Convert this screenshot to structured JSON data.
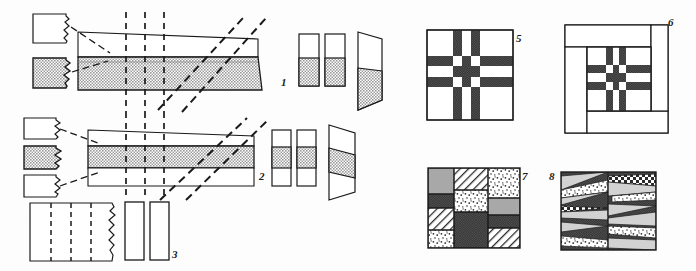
{
  "figure": {
    "type": "scientific-line-drawing",
    "background_color": "#fdfdfd",
    "ink_color": "#1a1a1a",
    "fill_gray": "#a8a8a8",
    "fill_dark": "#3a3a3a",
    "fill_white": "#ffffff"
  },
  "labels": [
    {
      "id": "label-1",
      "text": "1",
      "x": 281,
      "y": 76
    },
    {
      "id": "label-2",
      "text": "2",
      "x": 259,
      "y": 176
    },
    {
      "id": "label-3",
      "text": "3",
      "x": 172,
      "y": 253
    },
    {
      "id": "label-5",
      "text": "5",
      "x": 516,
      "y": 36
    },
    {
      "id": "label-6",
      "text": "6",
      "x": 668,
      "y": 20
    },
    {
      "id": "label-7",
      "text": "7",
      "x": 520,
      "y": 176
    },
    {
      "id": "label-8",
      "text": "8",
      "x": 553,
      "y": 174
    }
  ],
  "panel1": {
    "name": "band-1-two-layer-slanted",
    "samples": [
      {
        "id": "sample-1-top",
        "fill": "#ffffff",
        "x": 33,
        "y": 14,
        "w": 38,
        "h": 29
      },
      {
        "id": "sample-1-bottom",
        "fill": "#a8a8a8",
        "x": 33,
        "y": 58,
        "w": 38,
        "h": 30
      }
    ],
    "band": {
      "top_layer_fill": "#ffffff",
      "bottom_layer_fill": "#a8a8a8",
      "x_start": 78,
      "x_end": 255
    },
    "columns": [
      {
        "id": "col-1a",
        "x": 298,
        "y": 34,
        "w": 20,
        "h": 52,
        "white_h": 24,
        "gray_h": 28
      },
      {
        "id": "col-1b",
        "x": 324,
        "y": 34,
        "w": 20,
        "h": 52,
        "white_h": 24,
        "gray_h": 28
      }
    ],
    "parallelogram": {
      "id": "par-1",
      "white_top": true,
      "gray_bottom": true
    }
  },
  "panel2": {
    "name": "band-2-three-layer-slanted",
    "samples": [
      {
        "id": "sample-2-top",
        "fill": "#ffffff",
        "x": 24,
        "y": 118,
        "w": 38,
        "h": 22
      },
      {
        "id": "sample-2-mid",
        "fill": "#a8a8a8",
        "x": 24,
        "y": 146,
        "w": 38,
        "h": 24
      },
      {
        "id": "sample-2-bot",
        "fill": "#ffffff",
        "x": 24,
        "y": 175,
        "w": 38,
        "h": 22
      }
    ],
    "band": {
      "top_layer_fill": "#ffffff",
      "mid_layer_fill": "#a8a8a8",
      "bottom_layer_fill": "#ffffff",
      "x_start": 88,
      "x_end": 253
    },
    "columns": [
      {
        "id": "col-2a",
        "x": 272,
        "y": 130,
        "w": 19,
        "h": 56
      },
      {
        "id": "col-2b",
        "x": 296,
        "y": 130,
        "w": 19,
        "h": 56
      }
    ],
    "parallelogram": {
      "id": "par-2",
      "white_top": true,
      "gray_mid": true,
      "white_bottom": true
    }
  },
  "panel3": {
    "name": "block-3-dashed-with-torn-edge",
    "main_block": {
      "id": "block-3-main",
      "x": 30,
      "y": 203,
      "w": 85,
      "h": 58,
      "fill": "#ffffff",
      "dashed_lines": 3
    },
    "columns": [
      {
        "id": "col-3a",
        "x": 125,
        "y": 202,
        "w": 19,
        "h": 58
      },
      {
        "id": "col-3b",
        "x": 150,
        "y": 202,
        "w": 19,
        "h": 58
      }
    ]
  },
  "panel5": {
    "name": "grid-5-lattice",
    "x": 427,
    "y": 30,
    "w": 86,
    "h": 90,
    "dark_fill": "#3a3a3a",
    "v_stripes": [
      {
        "x": 26,
        "w": 9
      },
      {
        "x": 44,
        "w": 9
      }
    ],
    "h_stripes": [
      {
        "y": 26,
        "h": 10
      },
      {
        "y": 47,
        "h": 10
      }
    ]
  },
  "panel6": {
    "name": "grid-6-framed-lattice",
    "x": 565,
    "y": 25,
    "w": 103,
    "h": 108,
    "dark_fill": "#3a3a3a",
    "frame": {
      "band": 20
    },
    "inner": {
      "x": 20,
      "y": 20,
      "w": 63,
      "h": 68
    },
    "v_stripes": [
      {
        "x": 18,
        "w": 7
      },
      {
        "x": 31,
        "w": 7
      }
    ],
    "h_stripes": [
      {
        "y": 18,
        "h": 8
      },
      {
        "y": 35,
        "h": 8
      }
    ]
  },
  "panel7": {
    "name": "mosaic-7-rectangular-textures",
    "x": 428,
    "y": 168,
    "w": 92,
    "h": 80,
    "blocks": [
      {
        "id": "blk-7-1",
        "x": 0,
        "y": 0,
        "w": 26,
        "h": 26,
        "texture": "checker-gray"
      },
      {
        "id": "blk-7-2",
        "x": 26,
        "y": 0,
        "w": 34,
        "h": 22,
        "texture": "hatch-diag"
      },
      {
        "id": "blk-7-3",
        "x": 60,
        "y": 0,
        "w": 32,
        "h": 30,
        "texture": "speckle"
      },
      {
        "id": "blk-7-4",
        "x": 26,
        "y": 22,
        "w": 34,
        "h": 22,
        "texture": "speckle"
      },
      {
        "id": "blk-7-5",
        "x": 0,
        "y": 26,
        "w": 26,
        "h": 14,
        "texture": "solid-dark"
      },
      {
        "id": "blk-7-6",
        "x": 60,
        "y": 30,
        "w": 32,
        "h": 17,
        "texture": "checker-gray"
      },
      {
        "id": "blk-7-7",
        "x": 0,
        "y": 40,
        "w": 26,
        "h": 22,
        "texture": "hatch-diag"
      },
      {
        "id": "blk-7-8",
        "x": 26,
        "y": 44,
        "w": 34,
        "h": 36,
        "texture": "solid-dark"
      },
      {
        "id": "blk-7-9",
        "x": 60,
        "y": 47,
        "w": 32,
        "h": 13,
        "texture": "solid-dark"
      },
      {
        "id": "blk-7-10",
        "x": 0,
        "y": 62,
        "w": 26,
        "h": 18,
        "texture": "speckle"
      },
      {
        "id": "blk-7-11",
        "x": 60,
        "y": 60,
        "w": 32,
        "h": 20,
        "texture": "hatch-diag"
      }
    ]
  },
  "panel8": {
    "name": "mosaic-8-wedge-textures",
    "x": 561,
    "y": 172,
    "w": 95,
    "h": 78,
    "columns": 2,
    "textures": [
      "solid-dark",
      "light-gray",
      "speckle",
      "checker",
      "hatch"
    ]
  }
}
